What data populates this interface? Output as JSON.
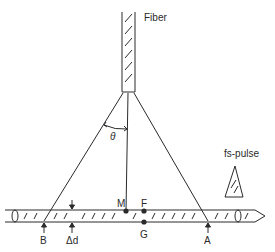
{
  "diagram": {
    "labels": {
      "fiber": "Fiber",
      "theta": "θ",
      "fs_pulse": "fs-pulse",
      "M": "M",
      "F": "F",
      "G": "G",
      "A": "A",
      "B": "B",
      "delta_d": "Δd"
    },
    "colors": {
      "line": "#2a2a2a",
      "background": "#ffffff"
    }
  }
}
